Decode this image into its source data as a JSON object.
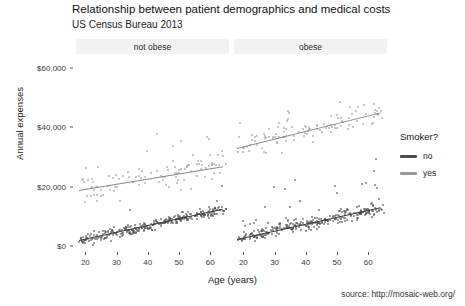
{
  "header": {
    "title": "Relationship between patient demographics and medical costs",
    "subtitle": "US Census Bureau 2013",
    "caption": "source: http://mosaic-web.org/"
  },
  "legend": {
    "title": "Smoker?",
    "entries": [
      {
        "label": "no",
        "color": "#4d4d4d"
      },
      {
        "label": "yes",
        "color": "#9a9a9a"
      }
    ]
  },
  "chart_data": {
    "type": "scatter",
    "title": "Relationship between patient demographics and medical costs",
    "subtitle": "US Census Bureau 2013",
    "caption": "source: http://mosaic-web.org/",
    "xlabel": "Age (years)",
    "ylabel": "Annual expenses",
    "xlim": [
      17,
      66
    ],
    "ylim": [
      -2000,
      64000
    ],
    "xticks": [
      20,
      30,
      40,
      50,
      60
    ],
    "xticklabels": [
      "20",
      "30",
      "40",
      "50",
      "60"
    ],
    "yticks": [
      0,
      20000,
      40000,
      60000
    ],
    "yticklabels": [
      "$0",
      "$20,000",
      "$40,000",
      "$60,000"
    ],
    "grid": false,
    "legend_position": "right",
    "facet_variable": "obesity",
    "facets": [
      {
        "label": "not obese",
        "series": [
          {
            "name": "no",
            "color": "#4d4d4d",
            "n_points": 300,
            "fit": {
              "x0": 18,
              "y0": 1900,
              "x1": 64,
              "y1": 12400
            },
            "spread": 1500,
            "outlier_fraction": 0.02,
            "outlier_boost": 9000
          },
          {
            "name": "yes",
            "color": "#9a9a9a",
            "n_points": 105,
            "fit": {
              "x0": 18,
              "y0": 19000,
              "x1": 64,
              "y1": 27000
            },
            "spread": 4200,
            "outlier_fraction": 0.12,
            "outlier_boost": 13000
          }
        ]
      },
      {
        "label": "obese",
        "series": [
          {
            "name": "no",
            "color": "#4d4d4d",
            "n_points": 300,
            "fit": {
              "x0": 18,
              "y0": 2300,
              "x1": 64,
              "y1": 13000
            },
            "spread": 1600,
            "outlier_fraction": 0.1,
            "outlier_boost": 16000
          },
          {
            "name": "yes",
            "color": "#9a9a9a",
            "n_points": 110,
            "fit": {
              "x0": 18,
              "y0": 33000,
              "x1": 64,
              "y1": 45000
            },
            "spread": 3600,
            "outlier_fraction": 0.1,
            "outlier_boost": 11000
          }
        ]
      }
    ]
  },
  "layout": {
    "panels": [
      {
        "left": 76,
        "top": 56,
        "width": 153,
        "height": 196,
        "strip_left": 76,
        "strip_top": 39,
        "strip_width": 153
      },
      {
        "left": 234,
        "top": 56,
        "width": 153,
        "height": 196,
        "strip_left": 234,
        "strip_top": 39,
        "strip_width": 153
      }
    ]
  }
}
